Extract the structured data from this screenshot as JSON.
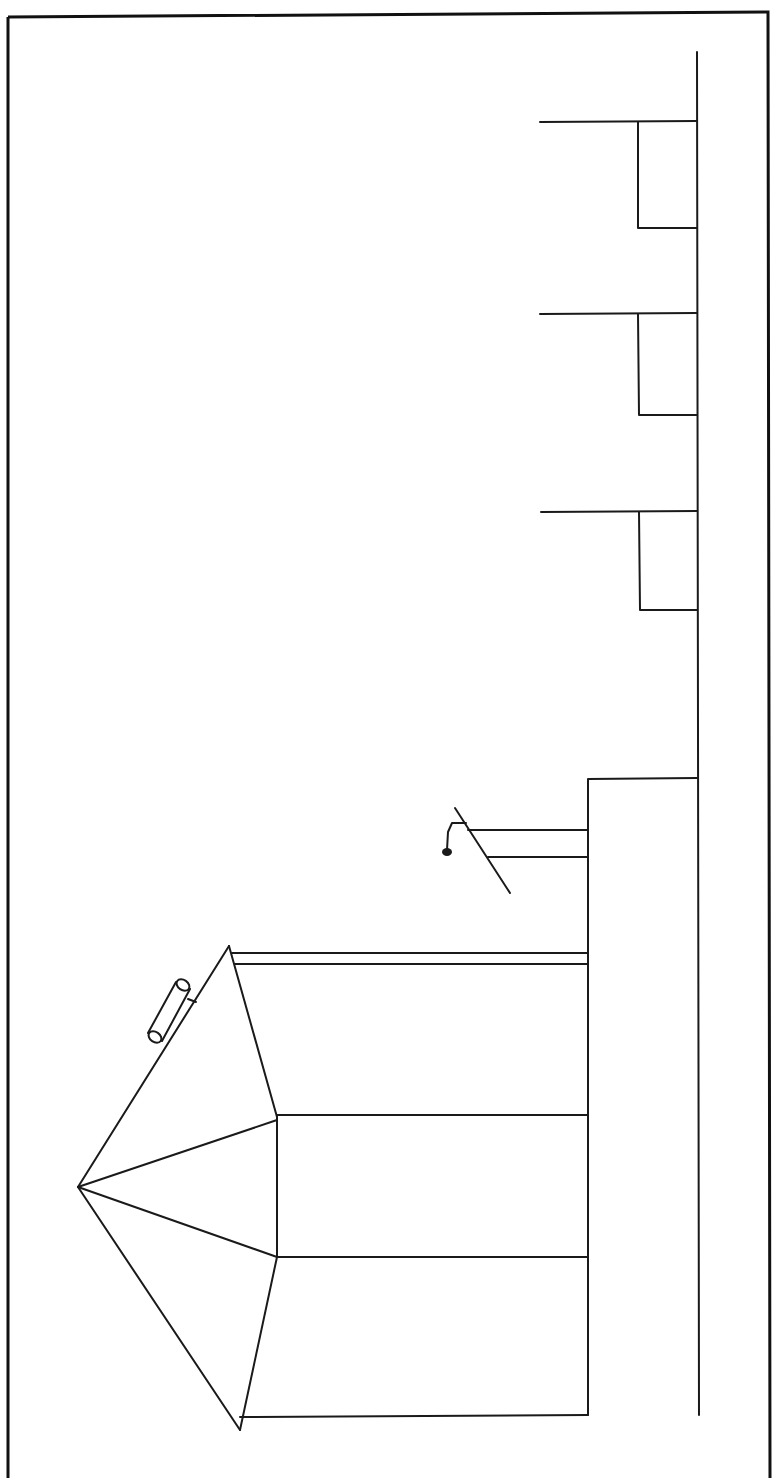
{
  "figure": {
    "kind": "line-drawing",
    "colors": {
      "background": "#ffffff",
      "ink": "#1a1a1a"
    },
    "window_count": 3
  }
}
